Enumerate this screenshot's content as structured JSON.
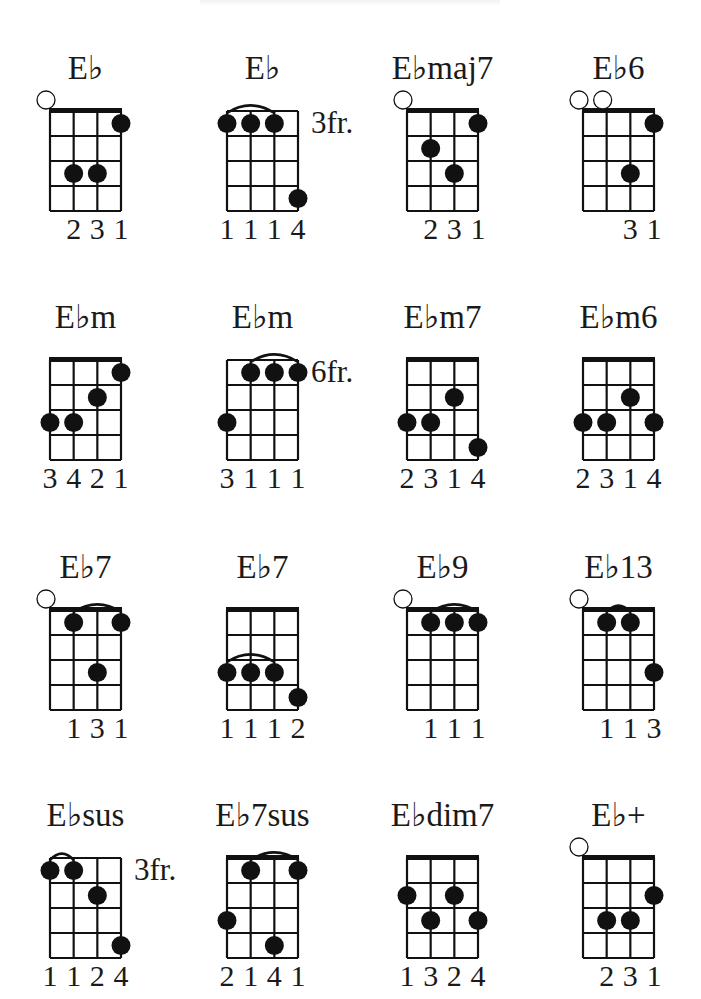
{
  "page": {
    "header_text_visible": false
  },
  "layout": {
    "columns_x": [
      50,
      227,
      407,
      583
    ],
    "rows_y": [
      111,
      360,
      610,
      858
    ],
    "grid_width": 71,
    "grid_height": 100,
    "strings": 4,
    "frets": 4,
    "dot_radius": 9.5,
    "open_radius": 9
  },
  "chords": [
    {
      "name": "E♭",
      "col": 0,
      "row": 0,
      "nut": true,
      "position": "",
      "open": [
        0
      ],
      "dots": [
        [
          3,
          1
        ],
        [
          1,
          3
        ],
        [
          2,
          3
        ]
      ],
      "barre": [],
      "fingers": [
        "",
        "2",
        "3",
        "1"
      ]
    },
    {
      "name": "E♭",
      "col": 1,
      "row": 0,
      "nut": false,
      "position": "3fr.",
      "open": [],
      "dots": [
        [
          0,
          1
        ],
        [
          1,
          1
        ],
        [
          2,
          1
        ],
        [
          3,
          4
        ]
      ],
      "barre": [
        0,
        2,
        1
      ],
      "fingers": [
        "1",
        "1",
        "1",
        "4"
      ]
    },
    {
      "name": "E♭maj7",
      "col": 2,
      "row": 0,
      "nut": true,
      "position": "",
      "open": [
        0
      ],
      "dots": [
        [
          3,
          1
        ],
        [
          1,
          2
        ],
        [
          2,
          3
        ]
      ],
      "barre": [],
      "fingers": [
        "",
        "2",
        "3",
        "1"
      ]
    },
    {
      "name": "E♭6",
      "col": 3,
      "row": 0,
      "nut": true,
      "position": "",
      "open": [
        0,
        1
      ],
      "dots": [
        [
          3,
          1
        ],
        [
          2,
          3
        ]
      ],
      "barre": [],
      "fingers": [
        "",
        "",
        "3",
        "1"
      ]
    },
    {
      "name": "E♭m",
      "col": 0,
      "row": 1,
      "nut": true,
      "position": "",
      "open": [],
      "dots": [
        [
          3,
          1
        ],
        [
          2,
          2
        ],
        [
          0,
          3
        ],
        [
          1,
          3
        ]
      ],
      "barre": [],
      "fingers": [
        "3",
        "4",
        "2",
        "1"
      ]
    },
    {
      "name": "E♭m",
      "col": 1,
      "row": 1,
      "nut": false,
      "position": "6fr.",
      "open": [],
      "dots": [
        [
          1,
          1
        ],
        [
          2,
          1
        ],
        [
          3,
          1
        ],
        [
          0,
          3
        ]
      ],
      "barre": [
        1,
        3,
        1
      ],
      "fingers": [
        "3",
        "1",
        "1",
        "1"
      ]
    },
    {
      "name": "E♭m7",
      "col": 2,
      "row": 1,
      "nut": true,
      "position": "",
      "open": [],
      "dots": [
        [
          2,
          2
        ],
        [
          0,
          3
        ],
        [
          1,
          3
        ],
        [
          3,
          4
        ]
      ],
      "barre": [],
      "fingers": [
        "2",
        "3",
        "1",
        "4"
      ]
    },
    {
      "name": "E♭m6",
      "col": 3,
      "row": 1,
      "nut": true,
      "position": "",
      "open": [],
      "dots": [
        [
          2,
          2
        ],
        [
          0,
          3
        ],
        [
          1,
          3
        ],
        [
          3,
          3
        ]
      ],
      "barre": [],
      "fingers": [
        "2",
        "3",
        "1",
        "4"
      ]
    },
    {
      "name": "E♭7",
      "col": 0,
      "row": 2,
      "nut": true,
      "position": "",
      "open": [
        0
      ],
      "dots": [
        [
          1,
          1
        ],
        [
          3,
          1
        ],
        [
          2,
          3
        ]
      ],
      "barre": [
        1,
        3,
        1
      ],
      "fingers": [
        "",
        "1",
        "3",
        "1"
      ]
    },
    {
      "name": "E♭7",
      "col": 1,
      "row": 2,
      "nut": true,
      "position": "",
      "open": [],
      "dots": [
        [
          0,
          3
        ],
        [
          1,
          3
        ],
        [
          2,
          3
        ],
        [
          3,
          4
        ]
      ],
      "barre": [
        0,
        2,
        3
      ],
      "fingers": [
        "1",
        "1",
        "1",
        "2"
      ]
    },
    {
      "name": "E♭9",
      "col": 2,
      "row": 2,
      "nut": true,
      "position": "",
      "open": [
        0
      ],
      "dots": [
        [
          1,
          1
        ],
        [
          2,
          1
        ],
        [
          3,
          1
        ]
      ],
      "barre": [
        1,
        3,
        1
      ],
      "fingers": [
        "",
        "1",
        "1",
        "1"
      ]
    },
    {
      "name": "E♭13",
      "col": 3,
      "row": 2,
      "nut": true,
      "position": "",
      "open": [
        0
      ],
      "dots": [
        [
          1,
          1
        ],
        [
          2,
          1
        ],
        [
          3,
          3
        ]
      ],
      "barre": [
        1,
        2,
        1
      ],
      "fingers": [
        "",
        "1",
        "1",
        "3"
      ]
    },
    {
      "name": "E♭sus",
      "col": 0,
      "row": 3,
      "nut": false,
      "position": "3fr.",
      "open": [],
      "dots": [
        [
          0,
          1
        ],
        [
          1,
          1
        ],
        [
          2,
          2
        ],
        [
          3,
          4
        ]
      ],
      "barre": [
        0,
        1,
        1
      ],
      "fingers": [
        "1",
        "1",
        "2",
        "4"
      ]
    },
    {
      "name": "E♭7sus",
      "col": 1,
      "row": 3,
      "nut": true,
      "position": "",
      "open": [],
      "dots": [
        [
          1,
          1
        ],
        [
          3,
          1
        ],
        [
          0,
          3
        ],
        [
          2,
          4
        ]
      ],
      "barre": [
        1,
        3,
        1
      ],
      "fingers": [
        "2",
        "1",
        "4",
        "1"
      ]
    },
    {
      "name": "E♭dim7",
      "col": 2,
      "row": 3,
      "nut": true,
      "position": "",
      "open": [],
      "dots": [
        [
          0,
          2
        ],
        [
          2,
          2
        ],
        [
          1,
          3
        ],
        [
          3,
          3
        ]
      ],
      "barre": [],
      "fingers": [
        "1",
        "3",
        "2",
        "4"
      ]
    },
    {
      "name": "E♭+",
      "col": 3,
      "row": 3,
      "nut": true,
      "position": "",
      "open": [
        0
      ],
      "dots": [
        [
          3,
          2
        ],
        [
          1,
          3
        ],
        [
          2,
          3
        ]
      ],
      "barre": [],
      "fingers": [
        "",
        "2",
        "3",
        "1"
      ]
    }
  ]
}
